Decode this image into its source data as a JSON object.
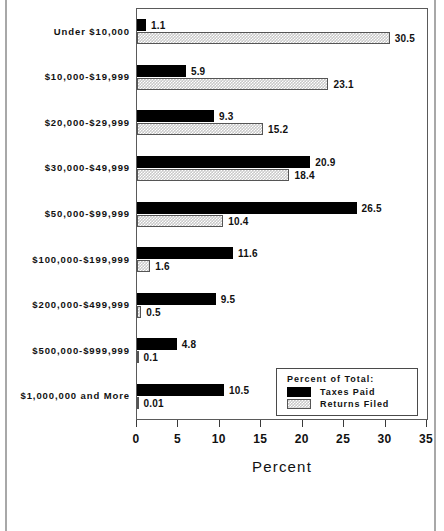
{
  "chart_data": {
    "type": "bar",
    "orientation": "horizontal",
    "title": "",
    "xlabel": "Percent",
    "ylabel": "",
    "xlim": [
      0,
      35
    ],
    "xticks": [
      0,
      5,
      10,
      15,
      20,
      25,
      30,
      35
    ],
    "xtick_labels": [
      "0",
      "5",
      "10",
      "15",
      "20",
      "25",
      "30",
      "35"
    ],
    "grid": false,
    "legend_position": "inside-bottom-right",
    "legend_title": "Percent of Total:",
    "categories": [
      "Under $10,000",
      "$10,000-$19,999",
      "$20,000-$29,999",
      "$30,000-$49,999",
      "$50,000-$99,999",
      "$100,000-$199,999",
      "$200,000-$499,999",
      "$500,000-$999,999",
      "$1,000,000 and More"
    ],
    "series": [
      {
        "name": "Taxes Paid",
        "fill": "solid-black",
        "color": "#000000",
        "values": [
          1.1,
          5.9,
          9.3,
          20.9,
          26.5,
          11.6,
          9.5,
          4.8,
          10.5
        ],
        "labels": [
          "1.1",
          "5.9",
          "9.3",
          "20.9",
          "26.5",
          "11.6",
          "9.5",
          "4.8",
          "10.5"
        ]
      },
      {
        "name": "Returns Filed",
        "fill": "checker-hatch",
        "color": "#c9c9c9",
        "values": [
          30.5,
          23.1,
          15.2,
          18.4,
          10.4,
          1.6,
          0.5,
          0.1,
          0.01
        ],
        "labels": [
          "30.5",
          "23.1",
          "15.2",
          "18.4",
          "10.4",
          "1.6",
          "0.5",
          "0.1",
          "0.01"
        ]
      }
    ]
  },
  "legend": {
    "title": "Percent of Total:",
    "entries": [
      {
        "label": "Taxes Paid",
        "swatch": "solid-black"
      },
      {
        "label": "Returns Filed",
        "swatch": "checker-hatch"
      }
    ]
  },
  "axis": {
    "x_title": "Percent"
  }
}
